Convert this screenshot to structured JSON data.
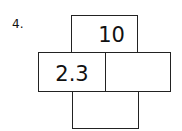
{
  "problem": {
    "number": "4.",
    "cells": {
      "top": "10",
      "middle_left": "2.3",
      "middle_right": "",
      "bottom": ""
    }
  }
}
